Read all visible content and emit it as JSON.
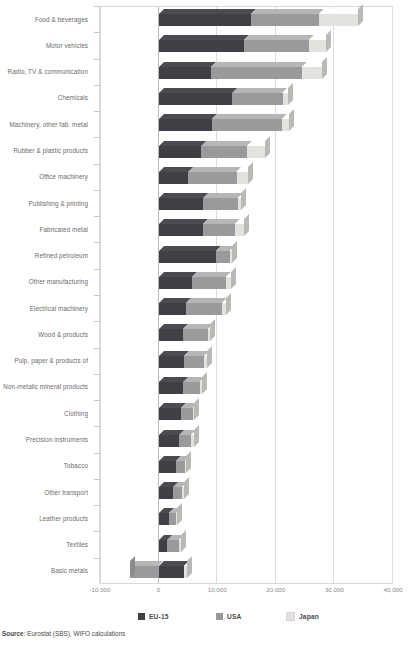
{
  "chart_data": {
    "type": "bar",
    "orientation": "horizontal",
    "stacked": true,
    "style": "3d",
    "title": "",
    "xlabel": "",
    "ylabel": "",
    "xlim": [
      -10000,
      40000
    ],
    "xticks": [
      -10000,
      0,
      10000,
      20000,
      30000,
      40000
    ],
    "xticklabels": [
      "-10,000",
      "0",
      "10,000",
      "20,000",
      "30,000",
      "40,000"
    ],
    "grid": true,
    "legend_position": "bottom",
    "categories": [
      "Food & beverages",
      "Motor vehicles",
      "Radio, TV & communication",
      "Chemicals",
      "Machinery, other fab. metal",
      "Rubber & plastic products",
      "Office machinery",
      "Publishing & printing",
      "Fabricated metal",
      "Refined petroleum",
      "Other manufacturing",
      "Electrical machinery",
      "Wood & products",
      "Pulp, paper & products of",
      "Non-metalic mineral products",
      "Clothing",
      "Precision instruments",
      "Tobacco",
      "Other transport",
      "Leather products",
      "Textiles",
      "Basic metals"
    ],
    "series": [
      {
        "name": "EU-15",
        "color": "#3f4045",
        "values": [
          15700,
          14500,
          8900,
          12600,
          9100,
          7300,
          5100,
          7600,
          7500,
          9800,
          5700,
          4600,
          4100,
          4300,
          4200,
          3800,
          3500,
          2900,
          2500,
          1700,
          1500,
          4300
        ]
      },
      {
        "name": "USA",
        "color": "#9a9a9c",
        "values": [
          11600,
          11100,
          15600,
          8600,
          11900,
          7800,
          8200,
          5900,
          5500,
          2400,
          5800,
          6200,
          4300,
          3500,
          2900,
          2100,
          2000,
          1600,
          1500,
          1200,
          2000,
          -4800
        ]
      },
      {
        "name": "Japan",
        "color": "#e2e2de",
        "values": [
          6800,
          2900,
          3400,
          900,
          1200,
          3100,
          1900,
          600,
          1600,
          300,
          900,
          700,
          300,
          400,
          300,
          200,
          600,
          200,
          400,
          200,
          300,
          600
        ]
      }
    ]
  },
  "legend": {
    "items": [
      {
        "label": "EU-15",
        "color": "#3f4045"
      },
      {
        "label": "USA",
        "color": "#9a9a9c"
      },
      {
        "label": "Japan",
        "color": "#e2e2de"
      }
    ]
  },
  "source": {
    "prefix": "Source",
    "text": ": Eurostat (SBS), WIFO calculations"
  }
}
